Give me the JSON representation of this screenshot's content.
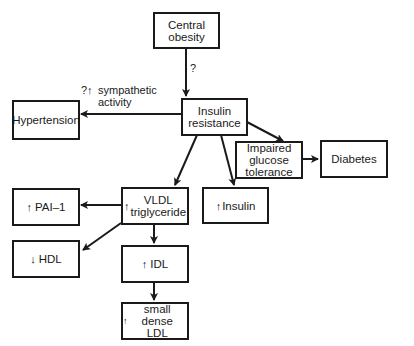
{
  "diagram": {
    "nodes": {
      "central_obesity": {
        "line1": "Central",
        "line2": "obesity"
      },
      "insulin_resistance": {
        "line1": "Insulin",
        "line2": "resistance"
      },
      "hypertension": {
        "label": "Hypertension"
      },
      "impaired_glucose": {
        "line1": "Impaired",
        "line2": "glucose",
        "line3": "tolerance"
      },
      "diabetes": {
        "label": "Diabetes"
      },
      "pai1": {
        "arrow": "↑",
        "label": "PAI–1"
      },
      "vldl": {
        "arrow": "↑",
        "line1": "VLDL",
        "line2": "triglyceride"
      },
      "insulin": {
        "arrow": "↑",
        "label": "Insulin"
      },
      "hdl": {
        "arrow": "↓",
        "label": "HDL"
      },
      "idl": {
        "arrow": "↑",
        "label": "IDL"
      },
      "sd_ldl": {
        "arrow": "↑",
        "line1": "small dense",
        "line2": "LDL"
      }
    },
    "edge_labels": {
      "obesity_to_resistance": "?",
      "sympathetic_prefix": "?↑",
      "sympathetic_line1": "sympathetic",
      "sympathetic_line2": "activity"
    }
  }
}
